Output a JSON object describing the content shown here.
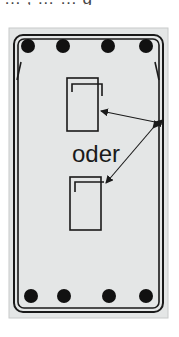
{
  "header": {
    "cropped_text": "… , … … g"
  },
  "diagram": {
    "panel_color": "#e4e6e6",
    "line_color": "#1a1a1a",
    "label": "oder",
    "top_bars_count": 4,
    "bottom_bars_count": 4,
    "alternatives": [
      "upper-stirrup",
      "lower-stirrup"
    ]
  }
}
